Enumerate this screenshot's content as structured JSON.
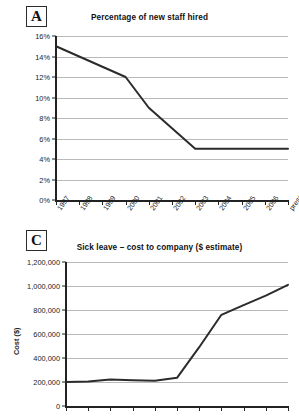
{
  "page": {
    "background": "#ffffff",
    "line_color": "#2b2b2b",
    "grid_color": "#b9b9b9",
    "axis_color": "#222222"
  },
  "panels": [
    {
      "id": "A",
      "label": "A"
    },
    {
      "id": "C",
      "label": "C"
    }
  ],
  "chart_data": [
    {
      "type": "line",
      "panel": "A",
      "title": "Percentage of new staff hired",
      "xlabel": "",
      "ylabel": "",
      "categories": [
        "1997",
        "1998",
        "1999",
        "2000",
        "2001",
        "2002",
        "2003",
        "2004",
        "2005",
        "2006",
        "present"
      ],
      "values": [
        15,
        14,
        13,
        12,
        9,
        7,
        5,
        5,
        5,
        5,
        5
      ],
      "ylim": [
        0,
        16
      ],
      "ytick_labels": [
        "0%",
        "2%",
        "4%",
        "6%",
        "8%",
        "10%",
        "12%",
        "14%",
        "16%"
      ],
      "ytick_values": [
        0,
        2,
        4,
        6,
        8,
        10,
        12,
        14,
        16
      ],
      "grid": true,
      "legend": "none",
      "unit": "%"
    },
    {
      "type": "line",
      "panel": "C",
      "title": "Sick leave – cost to company ($ estimate)",
      "xlabel": "",
      "ylabel": "Cost ($)",
      "categories": [
        "1997",
        "1998",
        "1999",
        "2000",
        "2001",
        "2002",
        "2003",
        "2004",
        "2005",
        "2006",
        "present"
      ],
      "values": [
        200000,
        205000,
        220000,
        215000,
        210000,
        235000,
        490000,
        760000,
        840000,
        920000,
        1010000
      ],
      "ylim": [
        0,
        1200000
      ],
      "ytick_labels": [
        "0",
        "200,000",
        "400,000",
        "600,000",
        "800,000",
        "1,000,000",
        "1,200,000"
      ],
      "ytick_values": [
        0,
        200000,
        400000,
        600000,
        800000,
        1000000,
        1200000
      ],
      "grid": true,
      "legend": "none",
      "unit": "$",
      "note": "x-axis tick marks visible; category labels cropped off bottom of image"
    }
  ]
}
